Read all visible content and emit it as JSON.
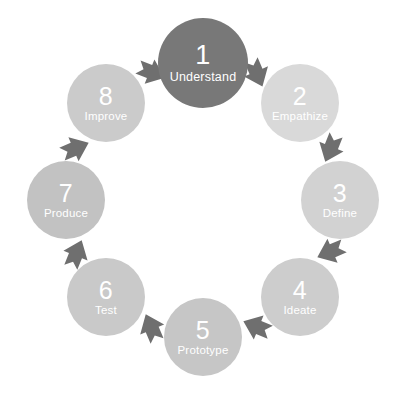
{
  "diagram": {
    "type": "cycle",
    "direction": "clockwise",
    "step_count": 8,
    "background_color": "#ffffff",
    "text_color": "#ffffff",
    "arrow_color": "#6f6f6f",
    "center": {
      "x": 203,
      "y": 200
    },
    "ring_radius": 137,
    "nodes": [
      {
        "number": "1",
        "label": "Understand",
        "color": "#787878",
        "radius": 45,
        "angle_deg": -90,
        "cx": 203,
        "cy": 63
      },
      {
        "number": "2",
        "label": "Empathize",
        "color": "#d9d9d9",
        "radius": 39,
        "angle_deg": -45,
        "cx": 300,
        "cy": 103
      },
      {
        "number": "3",
        "label": "Define",
        "color": "#d2d2d2",
        "radius": 39,
        "angle_deg": 0,
        "cx": 340,
        "cy": 200
      },
      {
        "number": "4",
        "label": "Ideate",
        "color": "#cdcdcd",
        "radius": 39,
        "angle_deg": 45,
        "cx": 300,
        "cy": 297
      },
      {
        "number": "5",
        "label": "Prototype",
        "color": "#c6c6c6",
        "radius": 39,
        "angle_deg": 90,
        "cx": 203,
        "cy": 337
      },
      {
        "number": "6",
        "label": "Test",
        "color": "#c9c9c9",
        "radius": 39,
        "angle_deg": 135,
        "cx": 106,
        "cy": 297
      },
      {
        "number": "7",
        "label": "Produce",
        "color": "#c2c2c2",
        "radius": 39,
        "angle_deg": 180,
        "cx": 66,
        "cy": 200
      },
      {
        "number": "8",
        "label": "Improve",
        "color": "#cbcbcb",
        "radius": 39,
        "angle_deg": -135,
        "cx": 106,
        "cy": 103
      }
    ],
    "arrows": [
      {
        "name": "arrow-8-to-1",
        "from": "8",
        "to": "1",
        "angle_deg": -112,
        "rotate": 22
      },
      {
        "name": "arrow-1-to-2",
        "from": "1",
        "to": "2",
        "angle_deg": -67,
        "rotate": 67
      },
      {
        "name": "arrow-2-to-3",
        "from": "2",
        "to": "3",
        "angle_deg": -22,
        "rotate": 112
      },
      {
        "name": "arrow-3-to-4",
        "from": "3",
        "to": "4",
        "angle_deg": 22,
        "rotate": 157
      },
      {
        "name": "arrow-4-to-5",
        "from": "4",
        "to": "5",
        "angle_deg": 67,
        "rotate": 202
      },
      {
        "name": "arrow-5-to-6",
        "from": "5",
        "to": "6",
        "angle_deg": 112,
        "rotate": 247
      },
      {
        "name": "arrow-6-to-7",
        "from": "6",
        "to": "7",
        "angle_deg": 157,
        "rotate": 292
      },
      {
        "name": "arrow-7-to-8",
        "from": "7",
        "to": "8",
        "angle_deg": 202,
        "rotate": 337
      }
    ]
  }
}
